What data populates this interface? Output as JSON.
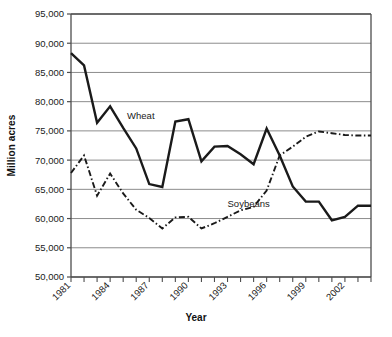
{
  "chart_data": {
    "type": "line",
    "title": "",
    "xlabel": "Year",
    "ylabel": "Million acres",
    "xlim": [
      1981,
      2004
    ],
    "ylim": [
      50000,
      95000
    ],
    "grid": true,
    "legend_position": "inline-annotations",
    "y_ticks": [
      "50,000",
      "55,000",
      "60,000",
      "65,000",
      "70,000",
      "75,000",
      "80,000",
      "85,000",
      "90,000",
      "95,000"
    ],
    "y_tick_values": [
      50000,
      55000,
      60000,
      65000,
      70000,
      75000,
      80000,
      85000,
      90000,
      95000
    ],
    "x_ticks": [
      "1981",
      "1984",
      "1987",
      "1990",
      "1993",
      "1996",
      "1999",
      "2002"
    ],
    "x_tick_values": [
      1981,
      1984,
      1987,
      1990,
      1993,
      1996,
      1999,
      2002
    ],
    "x_minor_ticks": [
      1981,
      1982,
      1983,
      1984,
      1985,
      1986,
      1987,
      1988,
      1989,
      1990,
      1991,
      1992,
      1993,
      1994,
      1995,
      1996,
      1997,
      1998,
      1999,
      2000,
      2001,
      2002,
      2003,
      2004
    ],
    "x": [
      1981,
      1982,
      1983,
      1984,
      1985,
      1986,
      1987,
      1988,
      1989,
      1990,
      1991,
      1992,
      1993,
      1994,
      1995,
      1996,
      1997,
      1998,
      1999,
      2000,
      2001,
      2002,
      2003,
      2004
    ],
    "series": [
      {
        "name": "Wheat",
        "style": "solid",
        "color": "#1a1a1a",
        "values": [
          88300,
          86200,
          76400,
          79200,
          75500,
          72000,
          65900,
          65400,
          76600,
          77000,
          69800,
          72300,
          72400,
          71000,
          69300,
          75400,
          70800,
          65500,
          62900,
          62900,
          59700,
          60300,
          62200,
          62200
        ]
      },
      {
        "name": "Soybeans",
        "style": "dash-dot",
        "color": "#1a1a1a",
        "values": [
          67800,
          70800,
          63900,
          67700,
          64300,
          61500,
          60100,
          58300,
          60200,
          60300,
          58300,
          59200,
          60300,
          61400,
          62000,
          64800,
          70800,
          72300,
          74000,
          74900,
          74600,
          74300,
          74200,
          74200
        ]
      }
    ],
    "annotations": [
      {
        "text": "Wheat",
        "x": 1985.3,
        "y": 77000
      },
      {
        "text": "Soybeans",
        "x": 1993.0,
        "y": 62000
      }
    ]
  }
}
